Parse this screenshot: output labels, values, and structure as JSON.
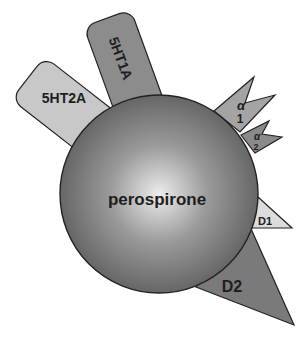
{
  "diagram": {
    "center_label": "perospirone",
    "receptors": [
      {
        "id": "5ht2a",
        "label": "5HT2A",
        "fill": "#c8c8c8"
      },
      {
        "id": "5ht1a",
        "label": "5HT1A",
        "fill": "#8c8c8c"
      },
      {
        "id": "alpha1",
        "symbol": "α",
        "subscript": "1",
        "fill": "#a4a4a4"
      },
      {
        "id": "alpha2",
        "symbol": "α",
        "subscript": "2",
        "fill": "#8a8a8a"
      },
      {
        "id": "d1",
        "label": "D1",
        "fill": "#dcdcdc"
      },
      {
        "id": "d2",
        "label": "D2",
        "fill": "#7a7a7a"
      }
    ],
    "colors": {
      "outline": "#222222",
      "sphere_highlight": "#e6e6e6",
      "sphere_mid": "#8a8a8a",
      "sphere_edge": "#5a5a5a"
    }
  }
}
